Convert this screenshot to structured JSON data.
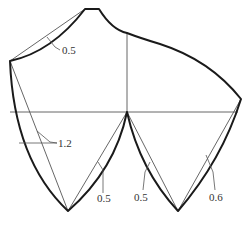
{
  "diagram": {
    "colors": {
      "outline": "#1a1a1a",
      "guide": "#555555",
      "label": "#333333"
    },
    "labels": {
      "top_left_curve": "0.5",
      "left_curve": "1.2",
      "center_left_curve": "0.5",
      "center_right_curve": "0.5",
      "right_curve": "0.6"
    }
  }
}
